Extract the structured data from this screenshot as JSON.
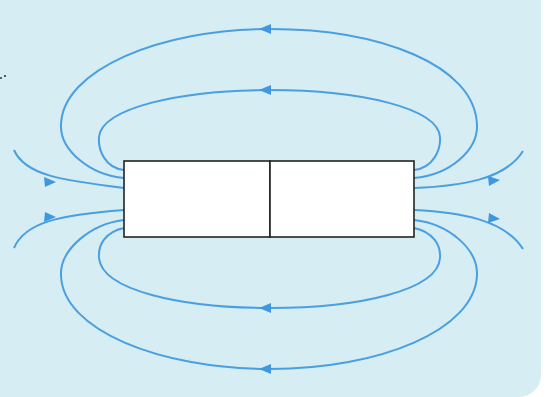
{
  "diagram": {
    "background_color": "#d5edf3",
    "line_color": "#4a9fe0",
    "magnet": {
      "x": 124,
      "y": 161,
      "width": 290,
      "height": 76,
      "divider_x": 270,
      "halves": [
        "left-pole",
        "right-pole"
      ],
      "fill": "#ffffff",
      "stroke": "#222222"
    },
    "field_lines": [
      {
        "name": "outer-top-loop",
        "arrow_direction": "left"
      },
      {
        "name": "inner-top-loop",
        "arrow_direction": "left"
      },
      {
        "name": "inner-bottom-loop",
        "arrow_direction": "left"
      },
      {
        "name": "outer-bottom-loop",
        "arrow_direction": "left"
      },
      {
        "name": "left-upper-open-line",
        "arrow_direction": "right"
      },
      {
        "name": "left-lower-open-line",
        "arrow_direction": "right"
      },
      {
        "name": "right-upper-open-line",
        "arrow_direction": "right"
      },
      {
        "name": "right-lower-open-line",
        "arrow_direction": "right"
      }
    ]
  }
}
